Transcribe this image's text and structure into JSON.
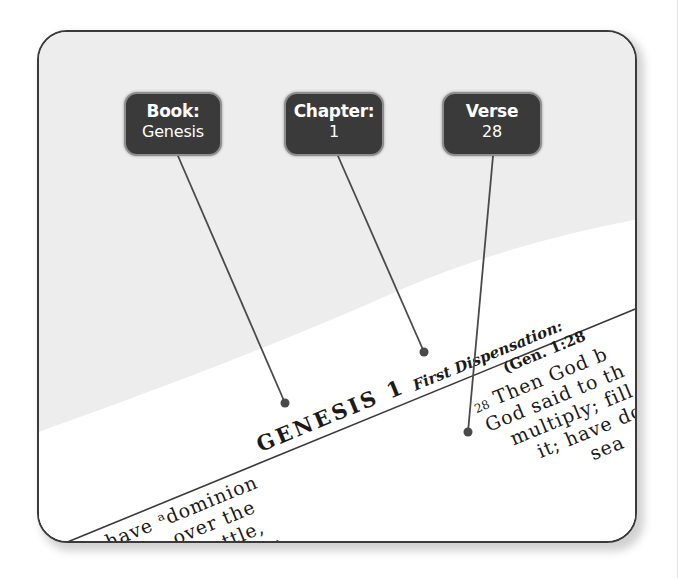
{
  "callouts": [
    {
      "label": "Book:",
      "value": "Genesis"
    },
    {
      "label": "Chapter:",
      "value": "1"
    },
    {
      "label": "Verse",
      "value": "28"
    }
  ],
  "page": {
    "heading": "GENESIS 1",
    "section_title": "First Dispensation:",
    "section_ref": "(Gen. 1:28",
    "verse_number": "28",
    "left_column_lines": [
      "em have ᵃdominion",
      "he sea, over the",
      "ver the cattle,",
      "ver every",
      "on the"
    ],
    "right_column_lines": [
      "Then God b",
      "God said to th",
      "multiply; fill",
      "it; have do",
      "sea"
    ]
  },
  "colors": {
    "callout_bg": "#3a3a3a",
    "callout_border": "#8e8e8e",
    "leader_line": "#4a4a4a",
    "page_shade": "#ededed",
    "frame_border": "#3a3a3a"
  }
}
